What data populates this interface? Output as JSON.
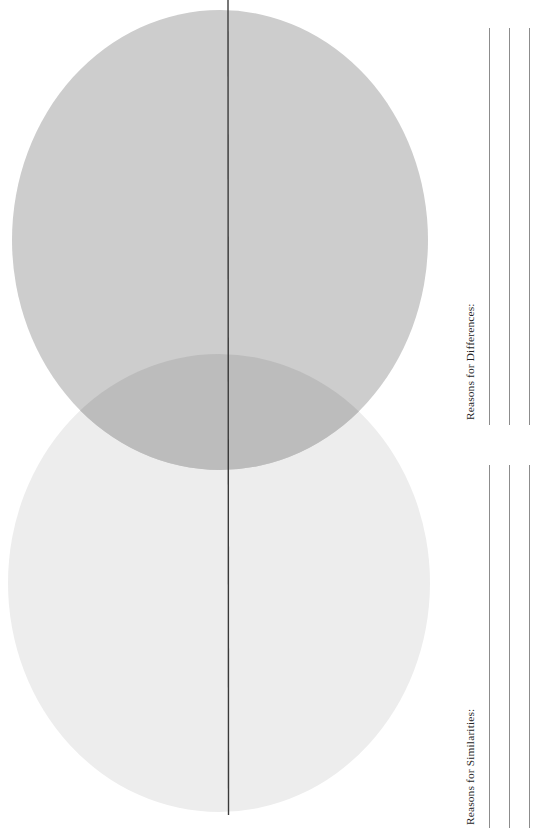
{
  "worksheet": {
    "type": "venn-diagram-worksheet",
    "background_color": "#ffffff"
  },
  "venn": {
    "title": "",
    "fold_line": {
      "name": "center-fold-line",
      "x": 228,
      "y_start": 0,
      "y_end": 815,
      "color": "#3a3a3a"
    },
    "circles": [
      {
        "id": "top-circle",
        "label": "",
        "cx": 220,
        "cy": 240,
        "rx": 208,
        "ry": 230,
        "fill": "#cdcdcd"
      },
      {
        "id": "bottom-circle",
        "label": "",
        "cx": 219,
        "cy": 583,
        "rx": 211,
        "ry": 229,
        "fill": "#ededed"
      }
    ],
    "overlap": {
      "id": "overlap-lens",
      "label": "",
      "fill": "#bcbcbc"
    }
  },
  "panel": {
    "sections": [
      {
        "id": "differences",
        "label": "Reasons for Differences:",
        "line_count": 3,
        "line_color": "#8c8c8c"
      },
      {
        "id": "similarities",
        "label": "Reasons for Similarities:",
        "line_count": 3,
        "line_color": "#8c8c8c"
      }
    ]
  }
}
